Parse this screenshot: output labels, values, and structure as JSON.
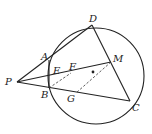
{
  "diagram": {
    "colors": {
      "stroke": "#222222",
      "background": "#ffffff"
    },
    "circle": {
      "cx": 96,
      "cy": 76,
      "r": 48
    },
    "points": {
      "P": {
        "label": "P",
        "x": 17,
        "y": 82
      },
      "A": {
        "label": "A",
        "x": 49,
        "y": 60
      },
      "B": {
        "label": "B",
        "x": 49,
        "y": 88
      },
      "D": {
        "label": "D",
        "x": 92,
        "y": 25
      },
      "C": {
        "label": "C",
        "x": 130,
        "y": 101
      },
      "M": {
        "label": "M",
        "x": 111,
        "y": 62
      },
      "E": {
        "label": "E",
        "x": 50,
        "y": 77
      },
      "F": {
        "label": "F",
        "x": 71,
        "y": 73
      },
      "G": {
        "label": "G",
        "x": 76,
        "y": 93
      },
      "O": {
        "label": "",
        "x": 93,
        "y": 72
      }
    }
  }
}
